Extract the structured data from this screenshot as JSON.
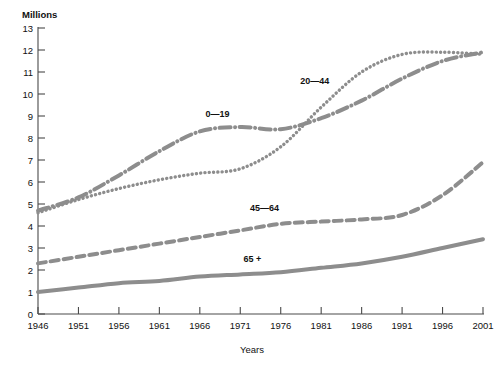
{
  "chart_data": {
    "type": "line",
    "title": "",
    "xlabel": "Years",
    "ylabel": "Millions",
    "ylim": [
      0,
      13
    ],
    "xlim": [
      1946,
      2001
    ],
    "grid": false,
    "legend_position": "inline-annotations",
    "y_ticks": [
      0,
      1,
      2,
      3,
      4,
      5,
      6,
      7,
      8,
      9,
      10,
      11,
      12,
      13
    ],
    "x_ticks": [
      1946,
      1951,
      1956,
      1961,
      1966,
      1971,
      1976,
      1981,
      1986,
      1991,
      1996,
      2001
    ],
    "x": [
      1946,
      1951,
      1956,
      1961,
      1966,
      1971,
      1976,
      1981,
      1986,
      1991,
      1996,
      2001
    ],
    "series": [
      {
        "name": "0—19",
        "line_style": "dash-dot",
        "color": "#8d8d8d",
        "values": [
          4.7,
          5.3,
          6.3,
          7.4,
          8.3,
          8.5,
          8.4,
          8.9,
          9.7,
          10.7,
          11.5,
          11.9
        ]
      },
      {
        "name": "20—44",
        "line_style": "dotted",
        "color": "#8d8d8d",
        "values": [
          4.6,
          5.2,
          5.7,
          6.1,
          6.4,
          6.6,
          7.6,
          9.4,
          11.0,
          11.8,
          11.9,
          11.8
        ]
      },
      {
        "name": "45—64",
        "line_style": "dashed",
        "color": "#8d8d8d",
        "values": [
          2.3,
          2.6,
          2.9,
          3.2,
          3.5,
          3.8,
          4.1,
          4.2,
          4.3,
          4.5,
          5.4,
          6.9
        ]
      },
      {
        "name": "65 +",
        "line_style": "solid",
        "color": "#8d8d8d",
        "values": [
          1.0,
          1.2,
          1.4,
          1.5,
          1.7,
          1.8,
          1.9,
          2.1,
          2.3,
          2.6,
          3.0,
          3.4
        ]
      }
    ],
    "annotations": [
      {
        "text": "0—19",
        "x": 1968.2,
        "y": 8.95
      },
      {
        "text": "20—44",
        "x": 1980.2,
        "y": 10.45
      },
      {
        "text": "45—64",
        "x": 1974.0,
        "y": 4.7
      },
      {
        "text": "65 +",
        "x": 1972.5,
        "y": 2.35
      }
    ]
  },
  "axis": {
    "y_title": "Millions",
    "x_title": "Years"
  },
  "top_fragment": ""
}
